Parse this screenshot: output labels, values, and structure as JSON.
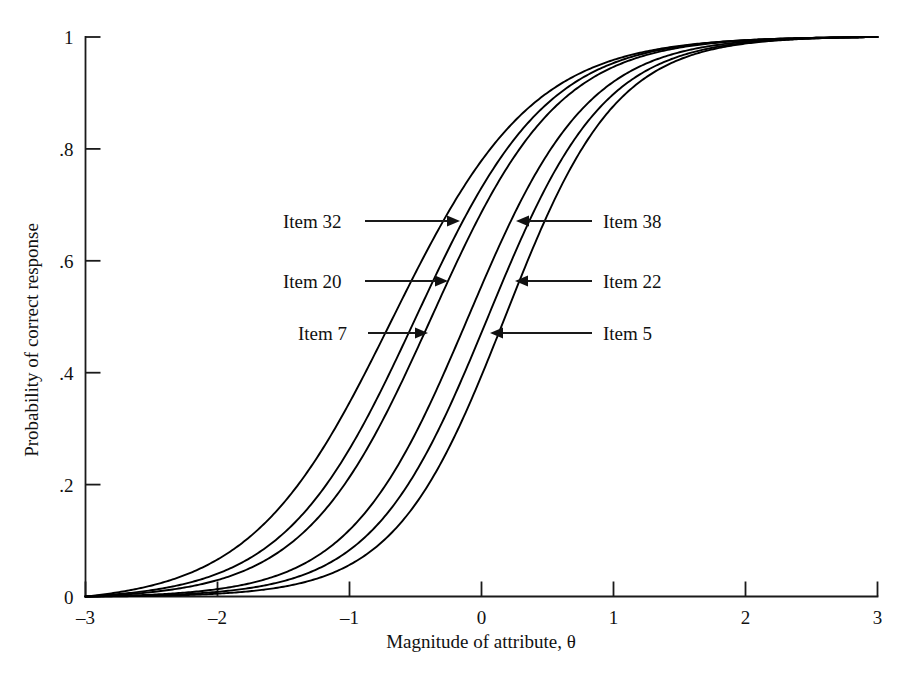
{
  "figure": {
    "title": "",
    "background": "#ffffff",
    "line_color": "#000000"
  },
  "axes": {
    "x_title": "Magnitude of attribute, θ",
    "y_title": "Probability of correct response",
    "x_ticks": [
      "–3",
      "–2",
      "–1",
      "0",
      "1",
      "2",
      "3"
    ],
    "y_ticks": [
      "0",
      ".2",
      ".4",
      ".6",
      ".8",
      "1"
    ]
  },
  "annotations": [
    {
      "label": "Item 32",
      "side": "left",
      "text_x": 283,
      "text_y": 228,
      "line_x1": 365,
      "line_x2": 452,
      "arrow_x": 460,
      "y": 221
    },
    {
      "label": "Item 20",
      "side": "left",
      "text_x": 283,
      "text_y": 288,
      "line_x1": 365,
      "line_x2": 440,
      "arrow_x": 448,
      "y": 281
    },
    {
      "label": "Item 7",
      "side": "left",
      "text_x": 298,
      "text_y": 340,
      "line_x1": 368,
      "line_x2": 420,
      "arrow_x": 428,
      "y": 333
    },
    {
      "label": "Item 38",
      "side": "right",
      "text_x": 603,
      "text_y": 228,
      "line_x1": 592,
      "line_x2": 524,
      "arrow_x": 516,
      "y": 221
    },
    {
      "label": "Item 22",
      "side": "right",
      "text_x": 603,
      "text_y": 288,
      "line_x1": 592,
      "line_x2": 523,
      "arrow_x": 515,
      "y": 281
    },
    {
      "label": "Item 5",
      "side": "right",
      "text_x": 603,
      "text_y": 340,
      "line_x1": 592,
      "line_x2": 498,
      "arrow_x": 490,
      "y": 333
    }
  ],
  "chart_data": {
    "type": "line",
    "title": "",
    "xlabel": "Magnitude of attribute, θ",
    "ylabel": "Probability of correct response",
    "xlim": [
      -3,
      3
    ],
    "ylim": [
      0,
      1
    ],
    "xticks": [
      -3,
      -2,
      -1,
      0,
      1,
      2,
      3
    ],
    "yticks": [
      0,
      0.2,
      0.4,
      0.6,
      0.8,
      1
    ],
    "grid": false,
    "legend": "inline-arrow-annotations",
    "model": "2-parameter logistic item characteristic curve, rescaled so P(-3)=0 and P(3)=1",
    "series": [
      {
        "name": "Item 32",
        "a": 1.1,
        "b": -0.68,
        "x": [
          -3,
          -2.5,
          -2,
          -1.5,
          -1,
          -0.68,
          -0.5,
          0,
          0.5,
          1,
          1.5,
          2,
          2.5,
          3
        ],
        "values": [
          0.0,
          0.055,
          0.116,
          0.203,
          0.329,
          0.425,
          0.478,
          0.628,
          0.757,
          0.849,
          0.909,
          0.946,
          0.969,
          1.0
        ]
      },
      {
        "name": "Item 20",
        "a": 1.18,
        "b": -0.5,
        "x": [
          -3,
          -2.5,
          -2,
          -1.5,
          -1,
          -0.5,
          0,
          0.5,
          1,
          1.5,
          2,
          2.5,
          3
        ],
        "values": [
          0.0,
          0.043,
          0.093,
          0.166,
          0.28,
          0.433,
          0.59,
          0.728,
          0.831,
          0.899,
          0.941,
          0.967,
          1.0
        ]
      },
      {
        "name": "Item 7",
        "a": 1.22,
        "b": -0.38,
        "x": [
          -3,
          -2.5,
          -2,
          -1.5,
          -1,
          -0.5,
          0,
          0.38,
          0.5,
          1,
          1.5,
          2,
          2.5,
          3
        ],
        "values": [
          0.0,
          0.038,
          0.083,
          0.15,
          0.256,
          0.403,
          0.561,
          0.673,
          0.707,
          0.817,
          0.89,
          0.936,
          0.964,
          1.0
        ]
      },
      {
        "name": "Item 38",
        "a": 1.3,
        "b": -0.1,
        "x": [
          -3,
          -2.5,
          -2,
          -1.5,
          -1,
          -0.5,
          0,
          0.5,
          1,
          1.5,
          2,
          2.5,
          3
        ],
        "values": [
          0.0,
          0.028,
          0.062,
          0.114,
          0.201,
          0.331,
          0.492,
          0.648,
          0.774,
          0.862,
          0.918,
          0.954,
          1.0
        ]
      },
      {
        "name": "Item 22",
        "a": 1.34,
        "b": 0.05,
        "x": [
          -3,
          -2.5,
          -2,
          -1.5,
          -1,
          -0.5,
          0,
          0.5,
          1,
          1.5,
          2,
          2.5,
          3
        ],
        "values": [
          0.0,
          0.024,
          0.054,
          0.099,
          0.177,
          0.297,
          0.452,
          0.613,
          0.749,
          0.846,
          0.908,
          0.949,
          1.0
        ]
      },
      {
        "name": "Item 5",
        "a": 1.4,
        "b": 0.18,
        "x": [
          -3,
          -2.5,
          -2,
          -1.5,
          -1,
          -0.5,
          0,
          0.18,
          0.5,
          1,
          1.5,
          2,
          2.5,
          3
        ],
        "values": [
          0.0,
          0.02,
          0.045,
          0.084,
          0.152,
          0.261,
          0.41,
          0.469,
          0.572,
          0.719,
          0.826,
          0.895,
          0.94,
          1.0
        ]
      }
    ]
  }
}
